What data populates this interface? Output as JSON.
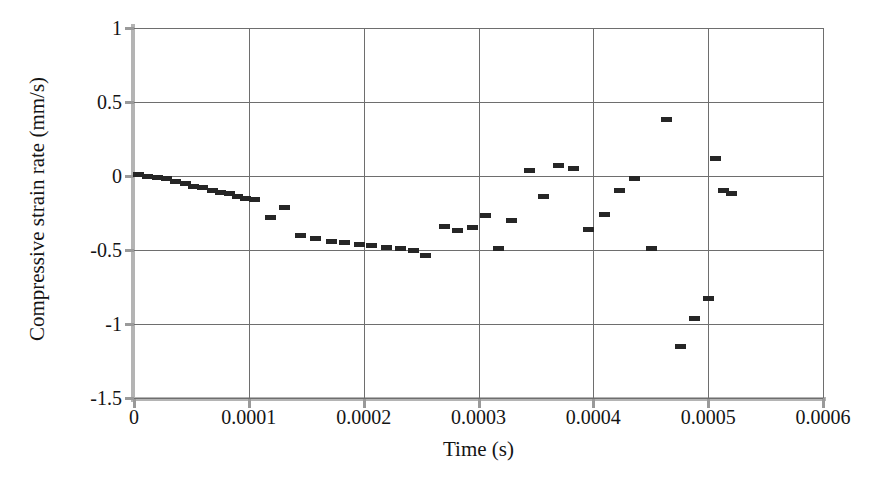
{
  "chart_data": {
    "type": "scatter",
    "title": "",
    "xlabel": "Time (s)",
    "ylabel": "Compressive strain rate (mm/s)",
    "xlim": [
      0,
      0.0006
    ],
    "ylim": [
      -1.5,
      1
    ],
    "xticks": [
      0,
      0.0001,
      0.0002,
      0.0003,
      0.0004,
      0.0005,
      0.0006
    ],
    "xtick_labels": [
      "0",
      "0.0001",
      "0.0002",
      "0.0003",
      "0.0004",
      "0.0005",
      "0.0006"
    ],
    "yticks": [
      1,
      0.5,
      0,
      -0.5,
      -1,
      -1.5
    ],
    "ytick_labels": [
      "1",
      "0.5",
      "0",
      "-0.5",
      "-1",
      "-1.5"
    ],
    "grid": true,
    "legend": null,
    "marker_style": "horizontal-dash",
    "marker_color": "#262626",
    "series": [
      {
        "name": "Compressive strain rate",
        "x": [
          3.5e-06,
          1.2e-05,
          2.05e-05,
          2.85e-05,
          3.65e-05,
          4.45e-05,
          5.2e-05,
          6e-05,
          6.8e-05,
          7.55e-05,
          8.3e-05,
          9e-05,
          9.75e-05,
          0.000105,
          0.000119,
          0.000131,
          0.000145,
          0.000158,
          0.000172,
          0.000183,
          0.000196,
          0.000207,
          0.00022,
          0.000232,
          0.000243,
          0.000254,
          0.00027,
          0.000282,
          0.000295,
          0.000306,
          0.000317,
          0.000329,
          0.000344,
          0.000357,
          0.00037,
          0.000383,
          0.000396,
          0.00041,
          0.000423,
          0.000436,
          0.000451,
          0.000464,
          0.000476,
          0.000488,
          0.0005,
          0.000506,
          0.000513
        ],
        "y": [
          0.01,
          0.0,
          -0.01,
          -0.02,
          -0.04,
          -0.05,
          -0.07,
          -0.08,
          -0.1,
          -0.11,
          -0.12,
          -0.14,
          -0.15,
          -0.16,
          -0.28,
          -0.21,
          -0.4,
          -0.42,
          -0.44,
          -0.45,
          -0.46,
          -0.47,
          -0.48,
          -0.49,
          -0.5,
          -0.54,
          -0.34,
          -0.37,
          -0.35,
          -0.27,
          -0.49,
          -0.3,
          0.04,
          -0.14,
          0.07,
          0.05,
          -0.36,
          -0.26,
          -0.1,
          -0.02,
          -0.49,
          0.38,
          -1.15,
          -0.96,
          -0.83,
          0.12,
          -0.1
        ],
        "extra_points": [
          {
            "x": 0.00052,
            "y": -0.12
          }
        ]
      }
    ]
  },
  "axes": {
    "y_title": "Compressive strain rate (mm/s)",
    "x_title": "Time (s)"
  }
}
